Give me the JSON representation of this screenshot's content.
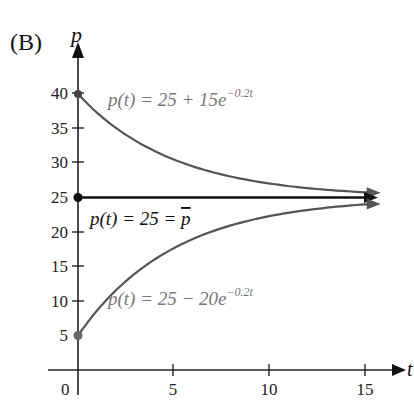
{
  "panel_label": "(B)",
  "top_cut_label": "(A) p",
  "chart_data": {
    "type": "line",
    "title": "",
    "xlabel": "t",
    "ylabel": "p",
    "xlim": [
      0,
      16
    ],
    "ylim": [
      0,
      43
    ],
    "x_ticks": [
      0,
      5,
      10,
      15
    ],
    "y_ticks": [
      5,
      10,
      15,
      20,
      25,
      30,
      35,
      40
    ],
    "grid": false,
    "series": [
      {
        "name": "p(t) = 25 + 15e^{-0.2t}",
        "formula": "25 + 15*exp(-0.2t)",
        "x": [
          0,
          5,
          10,
          15
        ],
        "values": [
          40,
          30.52,
          27.03,
          25.75
        ],
        "color": "#555555"
      },
      {
        "name": "p(t) = 25 = p̄",
        "formula": "25",
        "x": [
          0,
          5,
          10,
          15
        ],
        "values": [
          25,
          25,
          25,
          25
        ],
        "color": "#111111"
      },
      {
        "name": "p(t) = 25 - 20e^{-0.2t}",
        "formula": "25 - 20*exp(-0.2t)",
        "x": [
          0,
          5,
          10,
          15
        ],
        "values": [
          5,
          17.64,
          22.29,
          24.0
        ],
        "color": "#555555"
      }
    ],
    "annotations": [
      {
        "text_main": "p(t) = 25 + 15e",
        "text_sup": "−0.2t",
        "at": "upper curve"
      },
      {
        "text_main": "p(t) = 25 = ",
        "text_bar": "p",
        "at": "equilibrium line"
      },
      {
        "text_main": "p(t) = 25 − 20e",
        "text_sup": "−0.2t",
        "at": "lower curve"
      }
    ]
  },
  "labels": {
    "x_axis": "t",
    "y_axis": "p",
    "zero": "0",
    "upper_main": "p(t) = 25 + 15e",
    "upper_sup": "−0.2t",
    "mid_main": "p(t) = 25 = ",
    "mid_bar": "p",
    "lower_main": "p(t) = 25 − 20e",
    "lower_sup": "−0.2t",
    "xt": [
      "5",
      "10",
      "15"
    ],
    "yt": [
      "40",
      "35",
      "30",
      "25",
      "20",
      "15",
      "10",
      "5"
    ]
  }
}
